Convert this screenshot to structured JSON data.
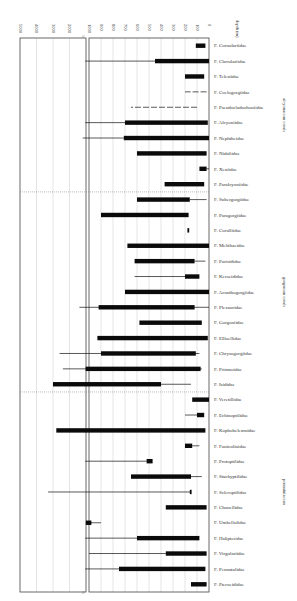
{
  "chart_data": {
    "type": "bar",
    "orientation": "horizontal range bars (figure rotated 90 degrees)",
    "title": "",
    "xlabel": "depth (m)",
    "ylabel": "",
    "x_ticks_main": [
      0,
      100,
      200,
      300,
      400,
      500,
      600,
      700,
      800,
      900,
      1000
    ],
    "x_ticks_extended": [
      2000,
      3000,
      4000,
      5000
    ],
    "xlim": [
      0,
      5000
    ],
    "axis_break": "//",
    "grid": true,
    "legend": [],
    "groups": [
      {
        "name": "alcyonacean corals",
        "families": [
          "F. Cornulariidae",
          "F. Clavulariidae",
          "F. Telestidae",
          "F. Coelogorgiidae",
          "F. Pseudocladochoniidae",
          "F. Alcyoniidae",
          "F. Nephtheidae",
          "F. Nidaliidae",
          "F. Xeniidae",
          "F. Paralcyoniidae"
        ]
      },
      {
        "name": "gorgonian corals",
        "families": [
          "F. Subergorgiidae",
          "F. Paragorgiidae",
          "F. Coralliidae",
          "F. Melithaeidae",
          "F. Parisididae",
          "F. Keroeididae",
          "F. Acanthogorgiidae",
          "F. Plexauridae",
          "F. Gorgoniidae",
          "F. Ellisellidae",
          "F. Chrysogorgiidae",
          "F. Primnoidae",
          "F. Isididae"
        ]
      },
      {
        "name": "pennatulacean",
        "families": [
          "F. Veretillidae",
          "F. Echinoptilidae",
          "F. Kophobelemnidae",
          "F. Funiculinidae",
          "F. Protoptilidae",
          "F. Stachyptilidae",
          "F. Scleroptilidae",
          "F. Chunellidae",
          "F. Umbellulidae",
          "F. Halipteridae",
          "F. Virgulariidae",
          "F. Pennatulidae",
          "F. Pteroeididae"
        ]
      }
    ],
    "series": [
      {
        "name": "F. Cornulariidae",
        "thick": [
          30,
          110
        ],
        "thin": null
      },
      {
        "name": "F. Clavulariidae",
        "thick": [
          0,
          450
        ],
        "thin": [
          450,
          1050
        ]
      },
      {
        "name": "F. Telestidae",
        "thick": [
          40,
          200
        ],
        "thin": null
      },
      {
        "name": "F. Coelogorgiidae",
        "thick": null,
        "thin": [
          20,
          200
        ],
        "style": "dashed"
      },
      {
        "name": "F. Pseudocladochoniidae",
        "thick": null,
        "thin": [
          100,
          650
        ],
        "style": "dashed"
      },
      {
        "name": "F. Alcyoniidae",
        "thick": [
          10,
          700
        ],
        "thin": [
          700,
          1050
        ]
      },
      {
        "name": "F. Nephtheidae",
        "thick": [
          0,
          710
        ],
        "thin": [
          710,
          1200
        ]
      },
      {
        "name": "F. Nidaliidae",
        "thick": [
          20,
          600
        ],
        "thin": null
      },
      {
        "name": "F. Xeniidae",
        "thick": [
          20,
          80
        ],
        "thin": [
          0,
          20
        ]
      },
      {
        "name": "F. Paralcyoniidae",
        "thick": [
          40,
          370
        ],
        "thin": null
      },
      {
        "name": "F. Subergorgiidae",
        "thick": [
          160,
          600
        ],
        "thin": [
          20,
          160
        ]
      },
      {
        "name": "F. Paragorgiidae",
        "thick": [
          170,
          900
        ],
        "thin": null
      },
      {
        "name": "F. Coralliidae",
        "thick": [
          165,
          180
        ],
        "thin": null
      },
      {
        "name": "F. Melithaeidae",
        "thick": [
          0,
          680
        ],
        "thin": null
      },
      {
        "name": "F. Parisididae",
        "thick": [
          120,
          620
        ],
        "thin": [
          30,
          120
        ]
      },
      {
        "name": "F. Keroeididae",
        "thick": [
          80,
          200
        ],
        "thin": [
          200,
          620
        ]
      },
      {
        "name": "F. Acanthogorgiidae",
        "thick": [
          0,
          700
        ],
        "thin": null
      },
      {
        "name": "F. Plexauridae",
        "thick": [
          120,
          920
        ],
        "thin": [
          0,
          1400
        ]
      },
      {
        "name": "F. Gorgoniidae",
        "thick": [
          60,
          580
        ],
        "thin": null
      },
      {
        "name": "F. Ellisellidae",
        "thick": [
          10,
          930
        ],
        "thin": null
      },
      {
        "name": "F. Chrysogorgiidae",
        "thick": [
          110,
          900
        ],
        "thin": [
          80,
          2600
        ]
      },
      {
        "name": "F. Primnoidae",
        "thick": [
          70,
          1020
        ],
        "thin": [
          60,
          2400
        ]
      },
      {
        "name": "F. Isididae",
        "thick": [
          400,
          3000
        ],
        "thin": [
          150,
          400
        ]
      },
      {
        "name": "F. Veretillidae",
        "thick": [
          0,
          140
        ],
        "thin": null
      },
      {
        "name": "F. Echinoptilidae",
        "thick": [
          40,
          100
        ],
        "thin": [
          100,
          200
        ]
      },
      {
        "name": "F. Kophobelemnidae",
        "thick": [
          30,
          2800
        ],
        "thin": null
      },
      {
        "name": "F. Funiculinidae",
        "thick": [
          140,
          200
        ],
        "thin": [
          80,
          140
        ]
      },
      {
        "name": "F. Protoptilidae",
        "thick": [
          470,
          520
        ],
        "thin": [
          520,
          1050
        ]
      },
      {
        "name": "F. Stachyptilidae",
        "thick": [
          150,
          650
        ],
        "thin": [
          60,
          150
        ]
      },
      {
        "name": "F. Scleroptilidae",
        "thick": [
          145,
          160
        ],
        "thin": [
          150,
          3300
        ]
      },
      {
        "name": "F. Chunellidae",
        "thick": [
          20,
          360
        ],
        "thin": null
      },
      {
        "name": "F. Umbellulidae",
        "thick": [
          980,
          1010
        ],
        "thin": [
          900,
          1000
        ]
      },
      {
        "name": "F. Halipteridae",
        "thick": [
          80,
          600
        ],
        "thin": [
          600,
          1050
        ]
      },
      {
        "name": "F. Virgulariidae",
        "thick": [
          20,
          360
        ],
        "thin": [
          360,
          1000
        ]
      },
      {
        "name": "F. Pennatulidae",
        "thick": [
          30,
          750
        ],
        "thin": [
          750,
          1050
        ]
      },
      {
        "name": "F. Pteroeididae",
        "thick": [
          20,
          150
        ],
        "thin": null
      }
    ]
  },
  "axis": {
    "label": "depth (m)",
    "break_mark": "//"
  }
}
